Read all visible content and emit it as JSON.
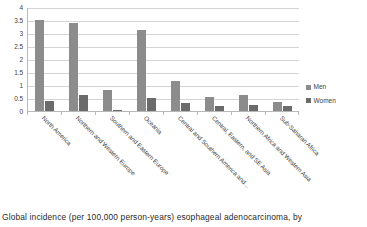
{
  "chart_data": {
    "type": "bar",
    "title": "",
    "xlabel": "",
    "ylabel": "",
    "ylim": [
      0,
      4
    ],
    "y_ticks": [
      "0",
      "0.5",
      "1",
      "1.5",
      "2",
      "2.5",
      "3",
      "3.5",
      "4"
    ],
    "grid": true,
    "legend_position": "right",
    "categories": [
      "North America",
      "Northern and Western Europe",
      "Southern and Eastern Europe",
      "Oceania",
      "Central and Southern America and…",
      "Central, Eastern, and SE Asia",
      "Northern Africa and Western Asia",
      "Sub-Saharan Africa"
    ],
    "series": [
      {
        "name": "Men",
        "color": "#8c8c8c",
        "values": [
          3.5,
          3.4,
          0.8,
          3.1,
          1.15,
          0.55,
          0.6,
          0.35
        ]
      },
      {
        "name": "Women",
        "color": "#6b6b6b",
        "values": [
          0.4,
          0.6,
          0.05,
          0.5,
          0.3,
          0.2,
          0.25,
          0.2
        ]
      }
    ]
  },
  "legend": {
    "items": [
      {
        "label": "Men"
      },
      {
        "label": "Women"
      }
    ]
  },
  "caption": {
    "text": "Global incidence (per 100,000 person-years) esophageal adenocarcinoma, by"
  }
}
